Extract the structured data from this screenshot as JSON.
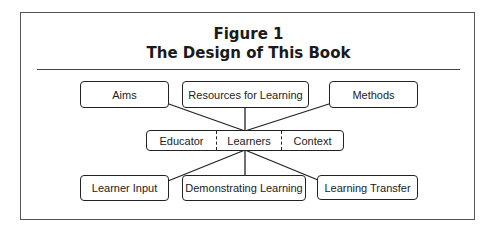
{
  "figure": {
    "label": "Figure 1",
    "title": "The Design of This Book"
  },
  "top_row": [
    {
      "label": "Aims"
    },
    {
      "label": "Resources for Learning"
    },
    {
      "label": "Methods"
    }
  ],
  "center": {
    "cells": [
      {
        "label": "Educator"
      },
      {
        "label": "Learners"
      },
      {
        "label": "Context"
      }
    ]
  },
  "bottom_row": [
    {
      "label": "Learner Input"
    },
    {
      "label": "Demonstrating Learning"
    },
    {
      "label": "Learning Transfer"
    }
  ],
  "colors": {
    "border": "#222222",
    "frame": "#555555",
    "background": "#ffffff"
  }
}
